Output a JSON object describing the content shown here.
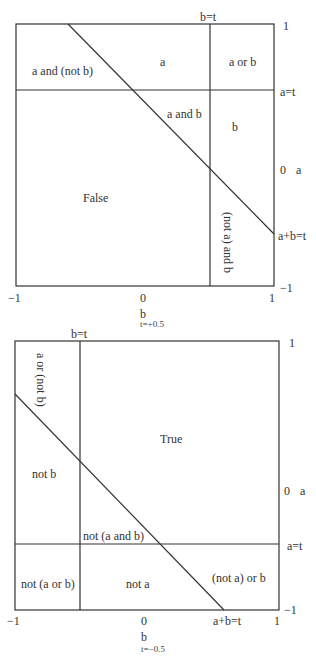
{
  "diagrams": [
    {
      "id": "t-plus",
      "caption": "t=+0.5",
      "x_axis": {
        "label": "b",
        "ticks": [
          "−1",
          "0",
          "1"
        ]
      },
      "y_axis": {
        "label": "a",
        "ticks": [
          "1",
          "0",
          "−1"
        ]
      },
      "line_labels": {
        "b_eq_t": "b=t",
        "a_eq_t": "a=t",
        "sum_eq_t": "a+b=t"
      },
      "regions": {
        "r1": "a and (not b)",
        "r2": "a",
        "r3": "a or b",
        "r4": "a and b",
        "r5": "b",
        "r6": "False",
        "r7": "(not a) and b"
      }
    },
    {
      "id": "t-minus",
      "caption": "t=−0.5",
      "x_axis": {
        "label": "b",
        "ticks": [
          "−1",
          "0",
          "1"
        ]
      },
      "y_axis": {
        "label": "a",
        "ticks": [
          "1",
          "0",
          "−1"
        ]
      },
      "line_labels": {
        "b_eq_t": "b=t",
        "a_eq_t": "a=t",
        "sum_eq_t": "a+b=t"
      },
      "regions": {
        "r1": "a or (not b)",
        "r2": "True",
        "r3": "not b",
        "r4": "not (a and b)",
        "r5": "not (a or b)",
        "r6": "not a",
        "r7": "(not a) or b"
      }
    }
  ]
}
